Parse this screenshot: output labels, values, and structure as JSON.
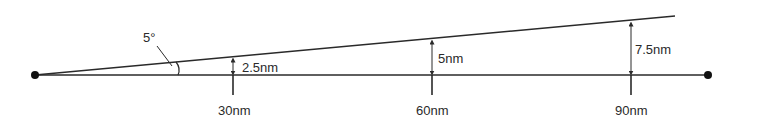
{
  "diagram": {
    "angle_label": "5°",
    "distance_labels": [
      "30nm",
      "60nm",
      "90nm"
    ],
    "offset_labels": [
      "2.5nm",
      "5nm",
      "7.5nm"
    ],
    "line_color": "#2a2a2a"
  }
}
